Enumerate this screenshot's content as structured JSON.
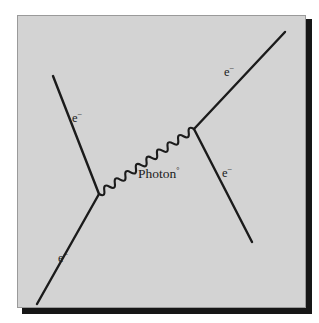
{
  "figure": {
    "kind": "feynman-diagram",
    "process_name": "Electron-electron scattering (Moller scattering)",
    "panel_background_color": "#d3d3d3",
    "ink_color": "#1b1b1b",
    "shadow_color": "#161616",
    "panel_border_color": "#9a9a9a"
  },
  "labels": {
    "incoming_upper_left": {
      "base": "e",
      "sup": "−"
    },
    "incoming_lower_left": {
      "base": "e",
      "sup": "−"
    },
    "outgoing_upper_right": {
      "base": "e",
      "sup": "−"
    },
    "outgoing_lower_right": {
      "base": "e",
      "sup": "−"
    },
    "mediator": {
      "base": "Photon",
      "sup": "°"
    }
  },
  "diagram_data": {
    "type": "feynman",
    "vertices": [
      {
        "name": "vertex-left",
        "x": 81,
        "y": 178
      },
      {
        "name": "vertex-right",
        "x": 176,
        "y": 113
      }
    ],
    "legs": [
      {
        "name": "leg-incoming-upper-left",
        "particle": "electron",
        "style": "straight",
        "from": {
          "x": 35,
          "y": 60
        },
        "to": {
          "x": 81,
          "y": 178
        }
      },
      {
        "name": "leg-incoming-lower-left",
        "particle": "electron",
        "style": "straight",
        "from": {
          "x": 81,
          "y": 178
        },
        "to": {
          "x": 19,
          "y": 288
        }
      },
      {
        "name": "leg-outgoing-upper-right",
        "particle": "electron",
        "style": "straight",
        "from": {
          "x": 176,
          "y": 113
        },
        "to": {
          "x": 267,
          "y": 16
        }
      },
      {
        "name": "leg-outgoing-lower-right",
        "particle": "electron",
        "style": "straight",
        "from": {
          "x": 176,
          "y": 113
        },
        "to": {
          "x": 234,
          "y": 226
        }
      },
      {
        "name": "leg-mediator-photon",
        "particle": "photon",
        "style": "wavy",
        "from": {
          "x": 81,
          "y": 178
        },
        "to": {
          "x": 176,
          "y": 113
        },
        "wave_amplitude": 5,
        "wave_count": 9
      }
    ]
  }
}
